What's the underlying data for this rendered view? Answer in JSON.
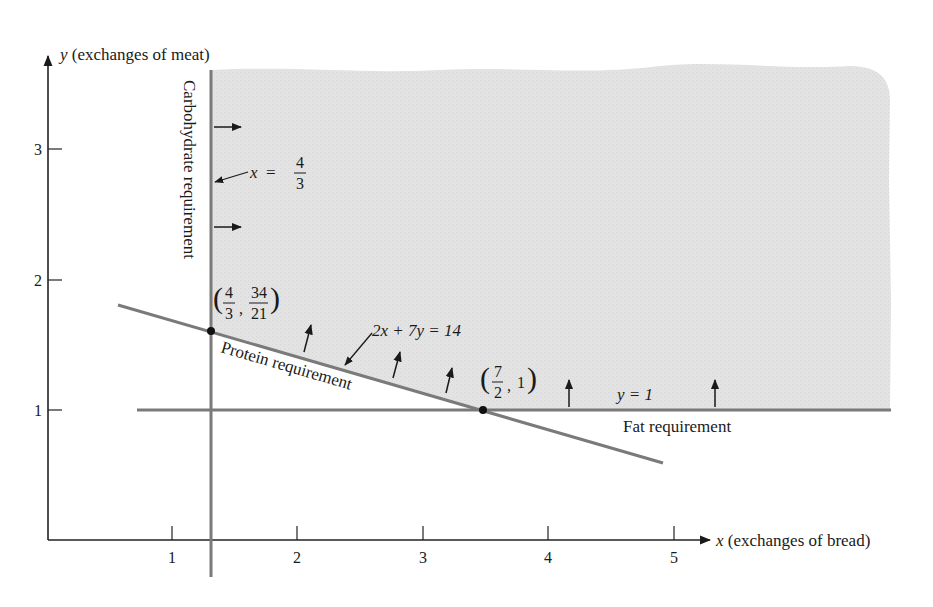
{
  "figure": {
    "y_axis_label_var": "y",
    "y_axis_label_text": "(exchanges of meat)",
    "x_axis_label_var": "x",
    "x_axis_label_text": "(exchanges of bread)",
    "x_ticks": [
      "1",
      "2",
      "3",
      "4",
      "5"
    ],
    "y_ticks": [
      "1",
      "2",
      "3"
    ]
  },
  "constraints": {
    "carbohydrate": {
      "label": "Carbohydrate requirement",
      "eq_lhs": "x",
      "eq_eq": "=",
      "eq_num": "4",
      "eq_den": "3"
    },
    "protein": {
      "label": "Protein requirement",
      "equation": "2x + 7y = 14"
    },
    "fat": {
      "label": "Fat requirement",
      "equation": "y = 1"
    }
  },
  "points": {
    "p1": {
      "x_num": "4",
      "x_den": "3",
      "y_num": "34",
      "y_den": "21"
    },
    "p2": {
      "x_num": "7",
      "x_den": "2",
      "y": "1"
    }
  },
  "colors": {
    "region_fill": "#e2e2e2",
    "constraint_line": "#7a7a7a",
    "axis": "#222222"
  }
}
